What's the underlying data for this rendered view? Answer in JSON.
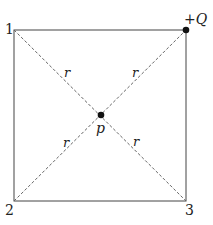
{
  "diagram": {
    "corners": {
      "c1": {
        "label": "1",
        "x": 14,
        "y": 30
      },
      "c2": {
        "label": "2",
        "x": 14,
        "y": 201
      },
      "c3": {
        "label": "3",
        "x": 186,
        "y": 201
      },
      "charge": {
        "label": "+Q",
        "x": 186,
        "y": 30
      }
    },
    "center": {
      "label": "p",
      "x": 101,
      "y": 115
    },
    "distance_label": "r",
    "colors": {
      "line": "#444444",
      "dashed": "#666666",
      "dot": "#111111"
    }
  }
}
